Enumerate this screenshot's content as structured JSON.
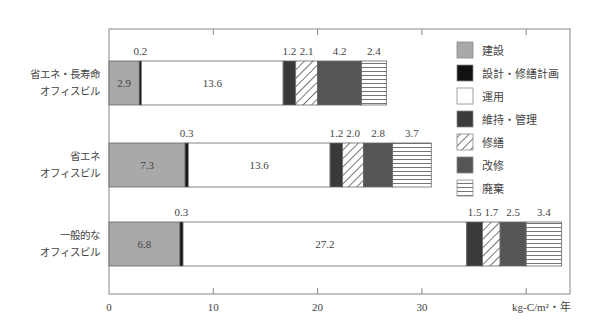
{
  "chart_data": {
    "type": "bar",
    "orientation": "horizontal",
    "stacked": true,
    "title": "",
    "xlabel": "kg-C/m²・年",
    "ylabel": "",
    "xlim": [
      0,
      40
    ],
    "x_ticks": [
      0,
      10,
      20,
      30
    ],
    "grid": false,
    "legend_position": "top-right-inside",
    "categories": [
      [
        "省エネ・長寿命",
        "オフィスビル"
      ],
      [
        "省エネ",
        "オフィスビル"
      ],
      [
        "一般的な",
        "オフィスビル"
      ]
    ],
    "series": [
      {
        "name": "建設",
        "color": "#a9a9a9",
        "pattern": "solid",
        "values": [
          2.9,
          7.3,
          6.8
        ]
      },
      {
        "name": "設計・修繕計画",
        "color": "#111111",
        "pattern": "solid",
        "values": [
          0.2,
          0.3,
          0.3
        ]
      },
      {
        "name": "運用",
        "color": "#ffffff",
        "pattern": "solid",
        "values": [
          13.6,
          13.6,
          27.2
        ]
      },
      {
        "name": "維持・管理",
        "color": "#3a3a3a",
        "pattern": "solid",
        "values": [
          1.2,
          1.2,
          1.5
        ]
      },
      {
        "name": "修繕",
        "color": "#ffffff",
        "pattern": "diagonal",
        "values": [
          2.1,
          2.0,
          1.7
        ]
      },
      {
        "name": "改修",
        "color": "#555555",
        "pattern": "solid",
        "values": [
          4.2,
          2.8,
          2.5
        ]
      },
      {
        "name": "廃棄",
        "color": "#ffffff",
        "pattern": "horizontal",
        "values": [
          2.4,
          3.7,
          3.4
        ]
      }
    ],
    "labels_inside": [
      "建設",
      "運用"
    ]
  }
}
